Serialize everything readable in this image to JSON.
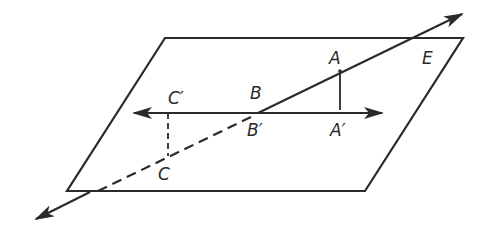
{
  "diagram": {
    "type": "geometry-plane-projection",
    "colors": {
      "stroke": "#2a2a2a",
      "background": "#ffffff"
    },
    "plane": {
      "vertices": [
        [
          165,
          38
        ],
        [
          463,
          38
        ],
        [
          365,
          191
        ],
        [
          67,
          191
        ]
      ]
    },
    "labels": {
      "A": "A",
      "A_prime": "A′",
      "B": "B",
      "B_prime": "B′",
      "C": "C",
      "C_prime": "C′",
      "E": "E"
    },
    "points": {
      "A": [
        340,
        71
      ],
      "A_prime": [
        340,
        113
      ],
      "B_prime": [
        258,
        113
      ],
      "C": [
        168,
        155
      ],
      "C_prime": [
        168,
        113
      ]
    }
  }
}
